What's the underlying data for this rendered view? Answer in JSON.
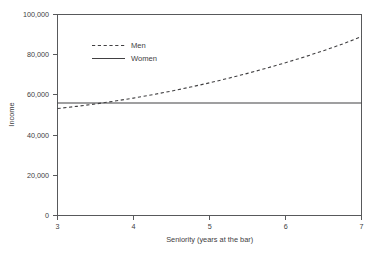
{
  "chart_data": {
    "type": "line",
    "title": "",
    "subtitle": "",
    "xlabel": "Seniority (years at the bar)",
    "ylabel": "Income",
    "xlim": [
      3,
      7
    ],
    "ylim": [
      0,
      100000
    ],
    "xticks": [
      3,
      4,
      5,
      6,
      7
    ],
    "xtick_labels": [
      "3",
      "4",
      "5",
      "6",
      "7"
    ],
    "yticks": [
      0,
      20000,
      40000,
      60000,
      80000,
      100000
    ],
    "ytick_labels": [
      "0",
      "20,000",
      "40,000",
      "60,000",
      "80,000",
      "100,000"
    ],
    "grid": false,
    "legend_position": "upper-left-inside",
    "x": [
      3,
      3.25,
      3.5,
      3.75,
      4,
      4.25,
      4.5,
      4.75,
      5,
      5.25,
      5.5,
      5.75,
      6,
      6.25,
      6.5,
      6.75,
      7
    ],
    "series": [
      {
        "name": "Men",
        "style": "dashed",
        "color": "#414042",
        "values": [
          53200,
          54300,
          55500,
          56900,
          58400,
          60100,
          61900,
          63900,
          66000,
          68300,
          70700,
          73300,
          76000,
          78900,
          82000,
          85300,
          89000
        ]
      },
      {
        "name": "Women",
        "style": "solid",
        "color": "#414042",
        "values": [
          56000,
          56000,
          56000,
          56000,
          56000,
          56000,
          56000,
          56000,
          56000,
          56000,
          56000,
          56000,
          56000,
          56000,
          56000,
          56000,
          56000
        ]
      }
    ],
    "annotations": []
  },
  "legend": {
    "entries": [
      {
        "label": "Men",
        "style": "dashed"
      },
      {
        "label": "Women",
        "style": "solid"
      }
    ]
  },
  "axes": {
    "x_title": "Seniority (years at the bar)",
    "y_title": "Income"
  }
}
